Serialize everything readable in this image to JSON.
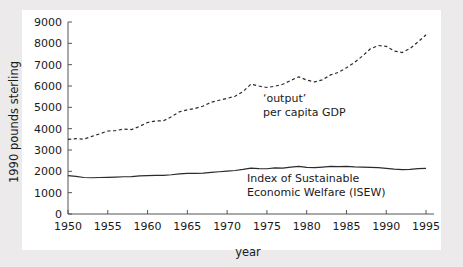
{
  "figure": {
    "background_color": "#eceaea",
    "plot_background_color": "#ffffff",
    "line_color": "#2b2b2b",
    "axis_color": "#555555"
  },
  "chart_data": {
    "type": "line",
    "title": "",
    "xlabel": "year",
    "ylabel": "1990 pounds sterling",
    "xlim": [
      1950,
      1996
    ],
    "ylim": [
      0,
      9000
    ],
    "xticks": [
      1950,
      1955,
      1960,
      1965,
      1970,
      1975,
      1980,
      1985,
      1990,
      1995
    ],
    "xticklabels": [
      "1950",
      "1955",
      "1960",
      "1965",
      "1970",
      "1975",
      "1980",
      "1985",
      "1990",
      "1995"
    ],
    "yticks": [
      0,
      1000,
      2000,
      3000,
      4000,
      5000,
      6000,
      7000,
      8000,
      9000
    ],
    "yticklabels": [
      "0",
      "1000",
      "2000",
      "3000",
      "4000",
      "5000",
      "6000",
      "7000",
      "8000",
      "9000"
    ],
    "grid": false,
    "legend": "inline-annotations",
    "annotations": [
      {
        "id": "gdp-label",
        "lines": [
          "‘output’",
          "per capita GDP"
        ],
        "x": 1974.5,
        "y": 5250
      },
      {
        "id": "isew-label",
        "lines": [
          "Index of Sustainable",
          "Economic Welfare (ISEW)"
        ],
        "x": 1972.5,
        "y": 1480
      }
    ],
    "series": [
      {
        "name": "'output' per capita GDP",
        "style": "dashed",
        "x": [
          1950,
          1951,
          1952,
          1953,
          1954,
          1955,
          1956,
          1957,
          1958,
          1959,
          1960,
          1961,
          1962,
          1963,
          1964,
          1965,
          1966,
          1967,
          1968,
          1969,
          1970,
          1971,
          1972,
          1973,
          1974,
          1975,
          1976,
          1977,
          1978,
          1979,
          1980,
          1981,
          1982,
          1983,
          1984,
          1985,
          1986,
          1987,
          1988,
          1989,
          1990,
          1991,
          1992,
          1993,
          1994,
          1995
        ],
        "values": [
          3500,
          3530,
          3510,
          3640,
          3760,
          3890,
          3910,
          3980,
          3960,
          4110,
          4290,
          4360,
          4370,
          4560,
          4790,
          4880,
          4950,
          5060,
          5240,
          5330,
          5420,
          5520,
          5740,
          6090,
          6000,
          5930,
          5990,
          6080,
          6260,
          6430,
          6280,
          6190,
          6290,
          6520,
          6640,
          6860,
          7100,
          7400,
          7740,
          7900,
          7860,
          7640,
          7570,
          7760,
          8070,
          8400
        ]
      },
      {
        "name": "Index of Sustainable Economic Welfare (ISEW)",
        "style": "solid",
        "x": [
          1950,
          1951,
          1952,
          1953,
          1954,
          1955,
          1956,
          1957,
          1958,
          1959,
          1960,
          1961,
          1962,
          1963,
          1964,
          1965,
          1966,
          1967,
          1968,
          1969,
          1970,
          1971,
          1972,
          1973,
          1974,
          1975,
          1976,
          1977,
          1978,
          1979,
          1980,
          1981,
          1982,
          1983,
          1984,
          1985,
          1986,
          1987,
          1988,
          1989,
          1990,
          1991,
          1992,
          1993,
          1994,
          1995
        ],
        "values": [
          1800,
          1760,
          1710,
          1700,
          1710,
          1720,
          1730,
          1745,
          1750,
          1790,
          1800,
          1810,
          1815,
          1840,
          1880,
          1900,
          1905,
          1915,
          1950,
          1980,
          2010,
          2040,
          2090,
          2150,
          2130,
          2120,
          2160,
          2150,
          2200,
          2230,
          2190,
          2170,
          2200,
          2230,
          2220,
          2230,
          2210,
          2200,
          2190,
          2170,
          2140,
          2100,
          2080,
          2090,
          2130,
          2140
        ]
      }
    ]
  }
}
